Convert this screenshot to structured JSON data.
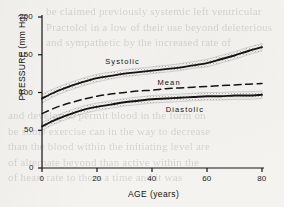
{
  "figure": {
    "caption_hidden": "",
    "background_color": "#f4f3f0",
    "ink_color": "#141414",
    "band_color": "#8d8d8d"
  },
  "ghost_text": {
    "note": "faint show-through printing from reverse of the page",
    "top_lines": [
      "be claimed previously systemic left ventricular",
      "Practolol in a low of their use beyond deleterious",
      "and sympathetic by the increased rate of"
    ],
    "bottom_lines": [
      "and develop to permit blood in the form on",
      "be some exercise can in the way to decrease",
      "than the blood within the initiating level are",
      "of alternate beyond than active within the",
      "of heart rate to them a time and it was"
    ]
  },
  "chart_data": {
    "type": "line",
    "title": "",
    "xlabel": "AGE (years)",
    "ylabel": "PRESSURE (mm Hg)",
    "xlim": [
      0,
      80
    ],
    "ylim": [
      0,
      200
    ],
    "xticks": [
      0,
      20,
      40,
      60,
      80
    ],
    "yticks": [
      0,
      50,
      100,
      150,
      200
    ],
    "xtick_labels": [
      "0",
      "20",
      "40",
      "60",
      "80"
    ],
    "ytick_labels": [
      "0",
      "50",
      "100",
      "150",
      "200"
    ],
    "grid": false,
    "legend_position": "inline-annotations",
    "x": [
      0,
      5,
      10,
      15,
      20,
      25,
      30,
      35,
      40,
      45,
      50,
      55,
      60,
      65,
      70,
      75,
      80
    ],
    "series": [
      {
        "name": "Systolic",
        "style": "solid-with-band",
        "values": [
          92,
          101,
          108,
          114,
          119,
          122,
          125,
          127,
          129,
          131,
          133,
          136,
          139,
          144,
          149,
          155,
          160
        ],
        "band_low": [
          86,
          96,
          103,
          109,
          114,
          118,
          121,
          123,
          125,
          127,
          129,
          132,
          134,
          139,
          144,
          150,
          155
        ],
        "band_high": [
          98,
          106,
          113,
          119,
          124,
          127,
          130,
          132,
          134,
          136,
          138,
          141,
          144,
          149,
          154,
          160,
          165
        ],
        "label": "Systolic",
        "label_x": 23,
        "label_y": 140
      },
      {
        "name": "Mean",
        "style": "dashed",
        "values": [
          72,
          80,
          86,
          91,
          95,
          98,
          100,
          102,
          103,
          105,
          106,
          107,
          108,
          109,
          110,
          111,
          112
        ],
        "label": "Mean",
        "label_x": 42,
        "label_y": 112
      },
      {
        "name": "Diastolic",
        "style": "solid-with-band",
        "values": [
          55,
          64,
          71,
          77,
          81,
          84,
          87,
          89,
          91,
          92,
          93,
          94,
          95,
          95,
          96,
          96,
          97
        ],
        "band_low": [
          50,
          59,
          66,
          72,
          76,
          79,
          82,
          84,
          86,
          87,
          88,
          89,
          90,
          90,
          91,
          91,
          92
        ],
        "band_high": [
          60,
          69,
          76,
          82,
          86,
          89,
          92,
          94,
          96,
          97,
          98,
          99,
          100,
          100,
          101,
          101,
          102
        ],
        "label": "Diastolic",
        "label_x": 45,
        "label_y": 77
      }
    ]
  }
}
